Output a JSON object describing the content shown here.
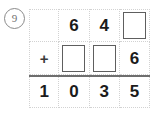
{
  "worksheet": {
    "problem_number": "9",
    "type": "vertical-addition",
    "operator": "+",
    "columns": 4,
    "rows": [
      {
        "role": "first-addend",
        "cells": [
          {
            "kind": "empty",
            "value": ""
          },
          {
            "kind": "digit",
            "value": "6"
          },
          {
            "kind": "digit",
            "value": "4"
          },
          {
            "kind": "blank-box",
            "value": ""
          }
        ]
      },
      {
        "role": "second-addend",
        "cells": [
          {
            "kind": "operator",
            "value": "+"
          },
          {
            "kind": "blank-box",
            "value": ""
          },
          {
            "kind": "blank-box",
            "value": ""
          },
          {
            "kind": "digit",
            "value": "6"
          }
        ]
      },
      {
        "role": "sum",
        "cells": [
          {
            "kind": "digit",
            "value": "1"
          },
          {
            "kind": "digit",
            "value": "0"
          },
          {
            "kind": "digit",
            "value": "3"
          },
          {
            "kind": "digit",
            "value": "5"
          }
        ]
      }
    ]
  },
  "colors": {
    "background": "#ffffff",
    "digit": "#1b1b1b",
    "grid_line": "#d2d2d2",
    "box_border": "#5e5e5e",
    "rule_line": "#6e6e6e",
    "badge": "#6f6f6f"
  }
}
